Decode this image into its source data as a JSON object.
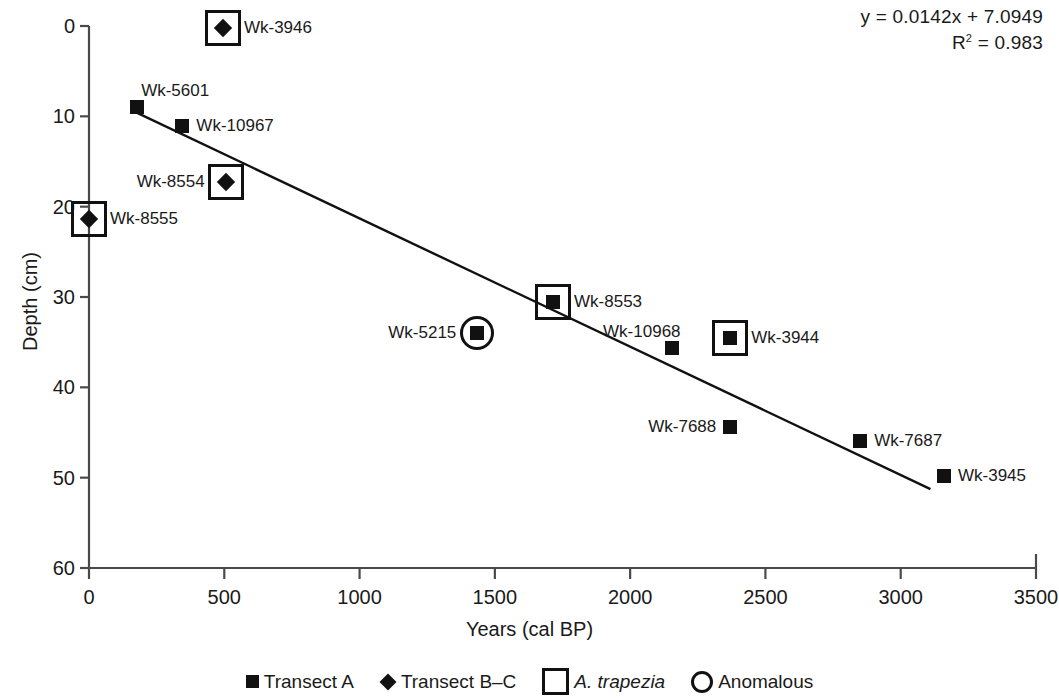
{
  "chart_data": {
    "type": "scatter",
    "title": "",
    "xlabel": "Years (cal BP)",
    "ylabel": "Depth (cm)",
    "xlim": [
      0,
      3500
    ],
    "ylim": [
      0,
      60
    ],
    "y_inverted": true,
    "grid": false,
    "xticks": [
      0,
      500,
      1000,
      1500,
      2000,
      2500,
      3000,
      3500
    ],
    "xtick_labels": [
      "0",
      "500",
      "1000",
      "1500",
      "2000",
      "2500",
      "3000",
      "3500"
    ],
    "yticks": [
      0,
      10,
      20,
      30,
      40,
      50,
      60
    ],
    "ytick_labels": [
      "0",
      "10",
      "20",
      "30",
      "40",
      "50",
      "60"
    ],
    "annotations": {
      "equation": "y = 0.0142x + 7.0949",
      "r_squared_prefix": "R",
      "r_squared_sup": "2",
      "r_squared_value": " = 0.983"
    },
    "trendline": {
      "slope": 0.0142,
      "intercept": 7.0949,
      "x_start": 180,
      "x_end": 3110,
      "y_start": 9.65,
      "y_end": 51.27
    },
    "legend": {
      "position": "bottom-center",
      "entries": [
        {
          "symbol": "filled-square",
          "label": "Transect A",
          "italic": false
        },
        {
          "symbol": "filled-diamond",
          "label": "Transect B–C",
          "italic": false
        },
        {
          "symbol": "open-square",
          "label": "A. trapezia",
          "italic": true
        },
        {
          "symbol": "open-circle",
          "label": "Anomalous",
          "italic": false
        }
      ]
    },
    "points": [
      {
        "label": "Wk-3946",
        "x": 495,
        "y": 0.2,
        "marker": "filled-diamond",
        "ring": "square",
        "label_side": "right"
      },
      {
        "label": "Wk-5601",
        "x": 178,
        "y": 9.0,
        "marker": "filled-square",
        "ring": "none",
        "label_side": "above-right"
      },
      {
        "label": "Wk-10967",
        "x": 345,
        "y": 11.1,
        "marker": "filled-square",
        "ring": "none",
        "label_side": "right"
      },
      {
        "label": "Wk-8554",
        "x": 505,
        "y": 17.3,
        "marker": "filled-diamond",
        "ring": "square",
        "label_side": "left"
      },
      {
        "label": "Wk-8555",
        "x": 0,
        "y": 21.4,
        "marker": "filled-diamond",
        "ring": "square",
        "label_side": "right"
      },
      {
        "label": "Wk-8553",
        "x": 1715,
        "y": 30.6,
        "marker": "filled-square",
        "ring": "square",
        "label_side": "right"
      },
      {
        "label": "Wk-5215",
        "x": 1435,
        "y": 34.0,
        "marker": "filled-square",
        "ring": "circle",
        "label_side": "left"
      },
      {
        "label": "Wk-10968",
        "x": 2155,
        "y": 35.7,
        "marker": "filled-square",
        "ring": "none",
        "label_side": "above-left"
      },
      {
        "label": "Wk-3944",
        "x": 2370,
        "y": 34.5,
        "marker": "filled-square",
        "ring": "square",
        "label_side": "right"
      },
      {
        "label": "Wk-7688",
        "x": 2370,
        "y": 44.4,
        "marker": "filled-square",
        "ring": "none",
        "label_side": "left"
      },
      {
        "label": "Wk-7687",
        "x": 2850,
        "y": 45.9,
        "marker": "filled-square",
        "ring": "none",
        "label_side": "right"
      },
      {
        "label": "Wk-3945",
        "x": 3160,
        "y": 49.8,
        "marker": "filled-square",
        "ring": "none",
        "label_side": "right"
      }
    ]
  }
}
